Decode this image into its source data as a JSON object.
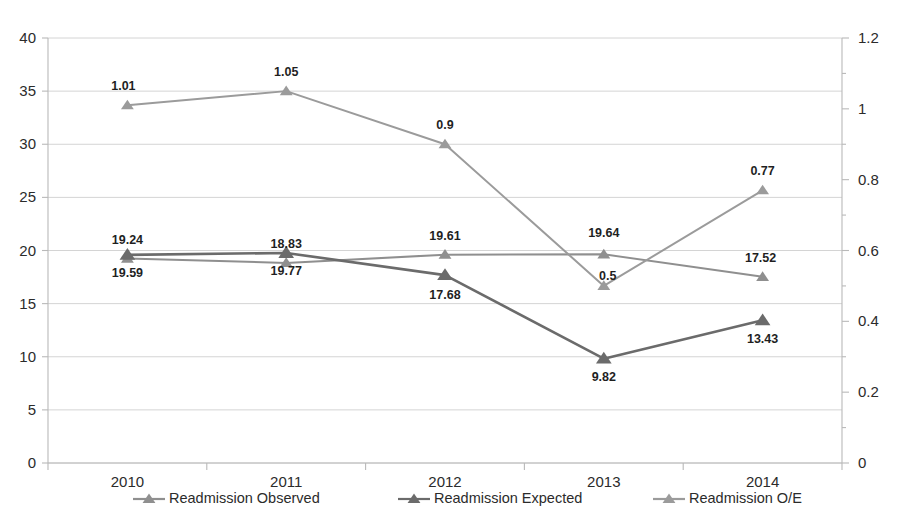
{
  "chart_data": {
    "type": "line",
    "title": "",
    "subtitle": "",
    "xlabel": "",
    "ylabel": "",
    "categories": [
      "2010",
      "2011",
      "2012",
      "2013",
      "2014"
    ],
    "grid": true,
    "legend_position": "bottom",
    "axes": {
      "left": {
        "ylim": [
          0,
          40
        ],
        "step": 5,
        "ticks": [
          "0",
          "5",
          "10",
          "15",
          "20",
          "25",
          "30",
          "35",
          "40"
        ],
        "tick_values": [
          0,
          5,
          10,
          15,
          20,
          25,
          30,
          35,
          40
        ]
      },
      "right": {
        "ylim": [
          0,
          1.2
        ],
        "step": 0.2,
        "ticks": [
          "0",
          "0.2",
          "0.4",
          "0.6",
          "0.8",
          "1",
          "1.2"
        ],
        "tick_values": [
          0,
          0.2,
          0.4,
          0.6,
          0.8,
          1,
          1.2
        ]
      }
    },
    "series": [
      {
        "name": "Readmission Observed",
        "axis": "left",
        "color": "#8f8f8f",
        "values": [
          19.24,
          18.83,
          19.61,
          19.64,
          17.52
        ],
        "labels": [
          "19.24",
          "18.83",
          "19.61",
          "19.64",
          "17.52"
        ],
        "label_position": [
          "above",
          "above",
          "above",
          "above",
          "above"
        ]
      },
      {
        "name": "Readmission Expected",
        "axis": "left",
        "color": "#6b6b6b",
        "values": [
          19.59,
          19.77,
          17.68,
          9.82,
          13.43
        ],
        "labels": [
          "19.59",
          "19.77",
          "17.68",
          "9.82",
          "13.43"
        ],
        "label_position": [
          "below",
          "below",
          "below",
          "below",
          "below"
        ]
      },
      {
        "name": "Readmission O/E",
        "axis": "right",
        "color": "#9b9b9b",
        "values": [
          1.01,
          1.05,
          0.9,
          0.5,
          0.77
        ],
        "labels": [
          "1.01",
          "1.05",
          "0.9",
          "0.5",
          "0.77"
        ],
        "label_position": [
          "above",
          "above",
          "above",
          "below",
          "above"
        ]
      }
    ]
  },
  "legend": {
    "items": [
      {
        "label": "Readmission Observed",
        "color": "#8f8f8f"
      },
      {
        "label": "Readmission Expected",
        "color": "#6b6b6b"
      },
      {
        "label": "Readmission O/E",
        "color": "#9b9b9b"
      }
    ]
  },
  "colors": {
    "background": "#ffffff",
    "gridline": "#d4d4d4",
    "axis": "#b9b9b9",
    "text": "#2b2b2b",
    "observed": "#8f8f8f",
    "expected": "#6b6b6b",
    "oe": "#9b9b9b"
  }
}
